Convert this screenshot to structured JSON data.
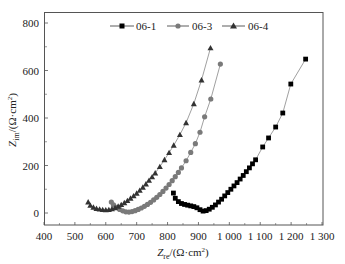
{
  "chart_data": {
    "type": "scatter",
    "title": "",
    "xlabel": "Zre/(Ω·cm²)",
    "xlabel_main": "Z",
    "xlabel_sub": "re",
    "xlabel_unit": "/(Ω·cm",
    "xlabel_sup": "2",
    "xlabel_end": ")",
    "ylabel": "Zim/(Ω·cm²)",
    "ylabel_main": "Z",
    "ylabel_sub": "im",
    "ylabel_unit": "/(Ω·cm",
    "ylabel_sup": "2",
    "ylabel_end": ")",
    "xlim": [
      400,
      1300
    ],
    "ylim": [
      -50,
      850
    ],
    "x_ticks": [
      400,
      500,
      600,
      700,
      800,
      900,
      1000,
      1100,
      1200,
      1300
    ],
    "x_tick_labels": [
      "400",
      "500",
      "600",
      "700",
      "800",
      "900",
      "1 000",
      "1 100",
      "1 200",
      "1 300"
    ],
    "y_ticks": [
      0,
      200,
      400,
      600,
      800
    ],
    "y_tick_labels": [
      "0",
      "200",
      "400",
      "600",
      "800"
    ],
    "grid": false,
    "legend_position": "top-left inside",
    "series": [
      {
        "name": "06-1",
        "marker": "square",
        "color": "#000000",
        "x": [
          819,
          825,
          835,
          845,
          855,
          865,
          875,
          885,
          895,
          905,
          915,
          925,
          935,
          945,
          955,
          965,
          975,
          985,
          995,
          1005,
          1015,
          1025,
          1035,
          1045,
          1055,
          1065,
          1075,
          1085,
          1108,
          1127,
          1150,
          1173,
          1199,
          1247
        ],
        "y": [
          84,
          62,
          48,
          40,
          36,
          33,
          30,
          27,
          22,
          14,
          8,
          10,
          16,
          24,
          34,
          46,
          58,
          72,
          86,
          100,
          114,
          128,
          143,
          158,
          174,
          190,
          207,
          224,
          278,
          316,
          362,
          421,
          543,
          648
        ]
      },
      {
        "name": "06-3",
        "marker": "circle",
        "color": "#7a7a7a",
        "x": [
          618,
          625,
          635,
          645,
          655,
          665,
          675,
          685,
          695,
          705,
          715,
          725,
          735,
          745,
          755,
          765,
          775,
          785,
          795,
          805,
          815,
          825,
          835,
          845,
          860,
          875,
          890,
          905,
          920,
          940,
          971
        ],
        "y": [
          46,
          34,
          24,
          15,
          9,
          5,
          4,
          6,
          10,
          15,
          21,
          28,
          36,
          45,
          55,
          66,
          78,
          91,
          105,
          120,
          136,
          153,
          171,
          190,
          220,
          255,
          292,
          340,
          405,
          480,
          627
        ]
      },
      {
        "name": "06-4",
        "marker": "triangle",
        "color": "#333333",
        "x": [
          543,
          550,
          560,
          570,
          580,
          590,
          600,
          610,
          620,
          630,
          640,
          650,
          660,
          670,
          680,
          690,
          700,
          710,
          720,
          730,
          740,
          750,
          760,
          775,
          790,
          805,
          820,
          840,
          860,
          885,
          910,
          939
        ],
        "y": [
          46,
          32,
          24,
          19,
          16,
          14,
          13,
          14,
          17,
          22,
          28,
          35,
          43,
          52,
          62,
          72,
          83,
          95,
          108,
          122,
          137,
          152,
          168,
          195,
          224,
          254,
          285,
          330,
          380,
          460,
          560,
          695
        ]
      }
    ]
  }
}
